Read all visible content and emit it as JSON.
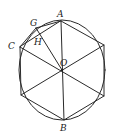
{
  "figure": {
    "circle": {
      "cx": 62,
      "cy": 70,
      "rx": 43,
      "ry": 50
    },
    "center": {
      "x": 62,
      "y": 70
    },
    "vertices": {
      "A": {
        "x": 61,
        "y": 21
      },
      "R1": {
        "x": 104,
        "y": 45
      },
      "R2": {
        "x": 104,
        "y": 96
      },
      "B": {
        "x": 64,
        "y": 120
      },
      "L2": {
        "x": 21,
        "y": 95
      },
      "C": {
        "x": 20,
        "y": 47
      }
    },
    "G": {
      "x": 36,
      "y": 28
    },
    "H": {
      "x": 40,
      "y": 36
    },
    "labels": {
      "A": "A",
      "G": "G",
      "C": "C",
      "H": "H",
      "O": "O",
      "B": "B"
    }
  }
}
